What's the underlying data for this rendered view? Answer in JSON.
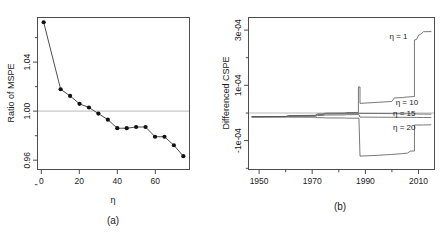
{
  "figure": {
    "panels": [
      {
        "id": "a",
        "caption": "(a)",
        "xlabel": "η",
        "ylabel": "Ratio of MSPE"
      },
      {
        "id": "b",
        "caption": "(b)",
        "xlabel": "",
        "ylabel": "Differenced CSPE"
      }
    ]
  },
  "chart_data": [
    {
      "type": "line",
      "panel": "a",
      "title": "",
      "xlabel": "η",
      "ylabel": "Ratio of MSPE",
      "xlim": [
        -2,
        78
      ],
      "ylim": [
        0.94,
        1.064
      ],
      "xticks": [
        0,
        20,
        40,
        60
      ],
      "xticklabels": [
        "0",
        "20",
        "40",
        "60"
      ],
      "yticks": [
        0.96,
        1.0,
        1.04
      ],
      "yticklabels": [
        "0.96",
        "1.00",
        "1.04"
      ],
      "yminorticks": [
        0.94,
        0.98,
        1.02,
        1.06
      ],
      "grid": false,
      "reference_line_y": 1.0,
      "legend": "none",
      "markers": "filled-circle",
      "x": [
        1,
        10,
        15,
        20,
        25,
        30,
        35,
        40,
        45,
        50,
        55,
        60,
        65,
        70,
        75
      ],
      "values": [
        1.0605,
        1.0055,
        1.0,
        0.9935,
        0.9905,
        0.9855,
        0.9805,
        0.9735,
        0.9735,
        0.9745,
        0.9745,
        0.9665,
        0.9665,
        0.9595,
        0.9505
      ]
    },
    {
      "type": "line",
      "panel": "b",
      "title": "",
      "xlabel": "",
      "ylabel": "Differenced CSPE",
      "xlim": [
        1946,
        2016
      ],
      "ylim": [
        -0.00019,
        0.00036
      ],
      "xticks": [
        1950,
        1970,
        1990,
        2010
      ],
      "xticklabels": [
        "1950",
        "1970",
        "1990",
        "2010"
      ],
      "xminorticks": [
        1960,
        1980,
        2000
      ],
      "yticks": [
        -0.0001,
        0.0001,
        0.0003
      ],
      "yticklabels": [
        "-1e-04",
        "1e-04",
        "3e-04"
      ],
      "yminorticks": [
        -0.0002,
        0.0,
        0.0002
      ],
      "grid": false,
      "reference_line_y": 0,
      "legend": "inline-annotations",
      "annotations": [
        {
          "label": "η = 1",
          "x": 2006,
          "y": 0.000295
        },
        {
          "label": "η = 10",
          "x": 2010,
          "y": 5.45e-05
        },
        {
          "label": "η = 15",
          "x": 2009,
          "y": 1.45e-05
        },
        {
          "label": "η = 20",
          "x": 2009,
          "y": -3.55e-05
        }
      ],
      "series": [
        {
          "name": "η = 1",
          "x": [
            1947,
            1960,
            1961,
            1971,
            1972,
            1974,
            1975,
            1982,
            1983,
            1987.4,
            1987.4,
            1988.0,
            1988.0,
            1995,
            2000,
            2001,
            2004,
            2005,
            2008.6,
            2008.6,
            2009.4,
            2010.2,
            2011,
            2012,
            2015
          ],
          "values": [
            0.0,
            1e-06,
            4.5e-06,
            5.5e-06,
            1.05e-05,
            1.1e-05,
            1.35e-05,
            1.4e-05,
            1.55e-05,
            1.6e-05,
            0.000109,
            0.000109,
            4.9e-05,
            5.3e-05,
            5.6e-05,
            6.9e-05,
            7e-05,
            7.15e-05,
            7.4e-05,
            0.00028,
            0.000282,
            0.000298,
            0.000301,
            0.00031,
            0.0003105
          ]
        },
        {
          "name": "η = 10",
          "x": [
            1947,
            1960,
            1961,
            1971,
            1972,
            1974,
            1975,
            1982,
            1983,
            1987.6,
            1988.0,
            1995,
            2000,
            2001,
            2004,
            2005,
            2008.6,
            2009.4,
            2012,
            2015
          ],
          "values": [
            0.0,
            8e-07,
            3.5e-06,
            4.2e-06,
            8.2e-06,
            8.6e-06,
            1.08e-05,
            1.12e-05,
            1.24e-05,
            1.28e-05,
            1.26e-05,
            1.22e-05,
            1.18e-05,
            1.16e-05,
            1.12e-05,
            1.1e-05,
            1.08e-05,
            1.04e-05,
            1e-05,
            9.8e-06
          ]
        },
        {
          "name": "η = 15",
          "x": [
            1947,
            1960,
            1961,
            1971,
            1972,
            1974,
            1975,
            1982,
            1983,
            1987.6,
            1988.0,
            1995,
            2000,
            2004,
            2008.6,
            2009.4,
            2012,
            2015
          ],
          "values": [
            0.0,
            4e-07,
            1.8e-06,
            2.2e-06,
            4.8e-06,
            5.2e-06,
            6.6e-06,
            7e-06,
            7.8e-06,
            8.2e-06,
            -1e-06,
            -1.4e-06,
            -1.6e-06,
            -1.8e-06,
            -2e-06,
            -2.2e-06,
            -2.4e-06,
            -2.6e-06
          ]
        },
        {
          "name": "η = 20",
          "x": [
            1947,
            1960,
            1961,
            1971,
            1972,
            1974,
            1975,
            1982,
            1983,
            1987.6,
            1987.6,
            1988.0,
            1988.0,
            1995,
            2000,
            2004,
            2006,
            2007,
            2008.6,
            2008.6,
            2009.4,
            2012,
            2015
          ],
          "values": [
            0.0,
            -4e-07,
            -1.2e-06,
            -1.4e-06,
            -3e-06,
            -3.2e-06,
            -4e-06,
            -4.2e-06,
            -4.8e-06,
            -5e-06,
            -5.2e-06,
            -0.000143,
            -0.000143,
            -0.00014,
            -0.000137,
            -0.000134,
            -0.000132,
            -0.000125,
            -0.0001245,
            -3e-05,
            -3e-05,
            -2.95e-05,
            -2.9e-05
          ]
        }
      ]
    }
  ]
}
